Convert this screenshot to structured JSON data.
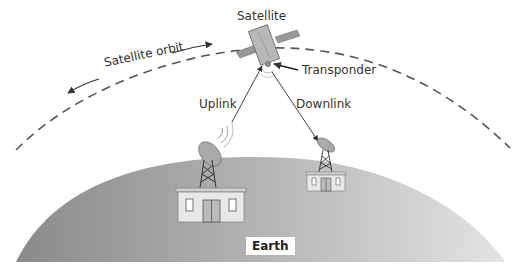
{
  "diagram": {
    "type": "satellite-communication",
    "labels": {
      "satellite": "Satellite",
      "orbit": "Satellite orbit",
      "transponder": "Transponder",
      "uplink": "Uplink",
      "downlink": "Downlink",
      "earth": "Earth"
    },
    "colors": {
      "earth_dark": "#8f8f8f",
      "earth_light": "#e2e2e2",
      "line": "#444444",
      "building": "#e6e6e6"
    }
  }
}
